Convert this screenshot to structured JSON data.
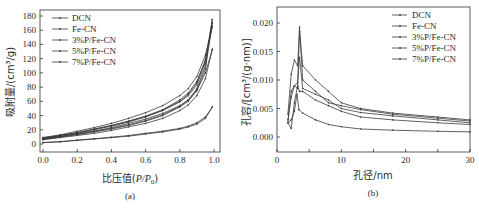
{
  "chart_data": [
    {
      "type": "line",
      "panel": "(a)",
      "title": "",
      "xlabel": "比压值(P/P0)",
      "ylabel": "吸附量/(cm³/g)",
      "xlim": [
        0,
        1.0
      ],
      "ylim": [
        -5,
        185
      ],
      "xticks": [
        "0.0",
        "0.2",
        "0.4",
        "0.6",
        "0.8",
        "1.0"
      ],
      "yticks": [
        "0",
        "20",
        "40",
        "60",
        "80",
        "100",
        "120",
        "140",
        "160",
        "180"
      ],
      "legend_position": "upper left",
      "x": [
        0.0,
        0.1,
        0.2,
        0.3,
        0.4,
        0.5,
        0.6,
        0.7,
        0.8,
        0.85,
        0.9,
        0.95,
        0.99
      ],
      "series": [
        {
          "name": "DCN",
          "adsorption": [
            2,
            3,
            5,
            7,
            9,
            11,
            14,
            17,
            21,
            24,
            28,
            36,
            52
          ],
          "desorption": [
            2,
            3.5,
            5.5,
            7.5,
            9.5,
            12,
            15,
            18,
            22,
            25,
            30,
            38,
            52
          ]
        },
        {
          "name": "Fe-CN",
          "adsorption": [
            8,
            11,
            14,
            18,
            22,
            27,
            33,
            41,
            53,
            62,
            78,
            110,
            175
          ],
          "desorption": [
            8,
            12,
            16,
            21,
            26,
            32,
            39,
            48,
            60,
            70,
            86,
            118,
            175
          ]
        },
        {
          "name": "3%P/Fe-CN",
          "adsorption": [
            7,
            10,
            13,
            17,
            21,
            26,
            32,
            40,
            52,
            60,
            75,
            105,
            170
          ],
          "desorption": [
            7,
            11,
            15,
            20,
            25,
            31,
            38,
            47,
            59,
            68,
            83,
            115,
            170
          ]
        },
        {
          "name": "5%P/Fe-CN",
          "adsorption": [
            6,
            9,
            12,
            15,
            19,
            24,
            29,
            36,
            47,
            55,
            68,
            92,
            133
          ],
          "desorption": [
            6,
            10,
            14,
            18,
            23,
            29,
            35,
            43,
            54,
            62,
            76,
            100,
            133
          ]
        },
        {
          "name": "7%P/Fe-CN",
          "adsorption": [
            9,
            12,
            16,
            21,
            26,
            32,
            39,
            48,
            62,
            72,
            88,
            118,
            165
          ],
          "desorption": [
            9,
            13,
            18,
            23,
            29,
            36,
            44,
            54,
            68,
            78,
            95,
            125,
            165
          ]
        }
      ]
    },
    {
      "type": "line",
      "panel": "(b)",
      "title": "",
      "xlabel": "孔径/nm",
      "ylabel": "孔容/[cm³/(g·nm)]",
      "xlim": [
        0,
        30
      ],
      "ylim": [
        -0.0025,
        0.0225
      ],
      "xticks": [
        "0",
        "10",
        "20",
        "30"
      ],
      "yticks": [
        "0.000",
        "0.005",
        "0.010",
        "0.015",
        "0.020"
      ],
      "legend_position": "upper right",
      "series": [
        {
          "name": "DCN",
          "x": [
            1.7,
            2.2,
            2.7,
            3.1,
            3.4,
            4,
            6,
            8,
            10,
            13,
            18,
            25,
            30
          ],
          "y": [
            0.0025,
            0.003,
            0.0045,
            0.0075,
            0.0048,
            0.0042,
            0.003,
            0.0022,
            0.0018,
            0.0014,
            0.0012,
            0.001,
            0.0009
          ]
        },
        {
          "name": "Fe-CN",
          "x": [
            1.7,
            2.2,
            2.7,
            3.2,
            3.5,
            4,
            6,
            8,
            10,
            13,
            18,
            25,
            30
          ],
          "y": [
            0.004,
            0.011,
            0.0135,
            0.0125,
            0.0185,
            0.0125,
            0.01,
            0.008,
            0.006,
            0.005,
            0.0042,
            0.0035,
            0.003
          ]
        },
        {
          "name": "3%P/Fe-CN",
          "x": [
            1.7,
            2.2,
            2.7,
            3.2,
            3.5,
            4,
            6,
            8,
            10,
            13,
            18,
            25,
            30
          ],
          "y": [
            0.0025,
            0.008,
            0.009,
            0.0085,
            0.0193,
            0.01,
            0.008,
            0.006,
            0.0055,
            0.0048,
            0.004,
            0.0033,
            0.0028
          ]
        },
        {
          "name": "5%P/Fe-CN",
          "x": [
            1.7,
            2.2,
            2.7,
            3.2,
            3.5,
            4,
            6,
            8,
            10,
            13,
            18,
            25,
            30
          ],
          "y": [
            0.003,
            0.007,
            0.009,
            0.0095,
            0.014,
            0.0085,
            0.0075,
            0.0065,
            0.005,
            0.0043,
            0.0037,
            0.003,
            0.0025
          ]
        },
        {
          "name": "7%P/Fe-CN",
          "x": [
            1.7,
            2.2,
            2.7,
            3.2,
            3.5,
            4,
            6,
            8,
            10,
            13,
            18,
            25,
            30
          ],
          "y": [
            0.0025,
            0.0015,
            0.006,
            0.009,
            0.008,
            0.008,
            0.0065,
            0.0055,
            0.0045,
            0.0035,
            0.003,
            0.0025,
            0.0022
          ]
        }
      ]
    }
  ],
  "panels": {
    "a": {
      "caption": "(a)",
      "xlabel_prefix": "比压值(",
      "xlabel_var": "P/P",
      "xlabel_sub": "0",
      "xlabel_suffix": ")",
      "ylabel": "吸附量/(cm³/g)",
      "legend": [
        "DCN",
        "Fe-CN",
        "3%P/Fe-CN",
        "5%P/Fe-CN",
        "7%P/Fe-CN"
      ]
    },
    "b": {
      "caption": "(b)",
      "xlabel": "孔径/nm",
      "ylabel": "孔容/[cm³/(g·nm)]",
      "legend": [
        "DCN",
        "Fe-CN",
        "3%P/Fe-CN",
        "5%P/Fe-CN",
        "7%P/Fe-CN"
      ]
    }
  },
  "colors": {
    "axis": "#333333",
    "line": "#3a3a3a"
  }
}
